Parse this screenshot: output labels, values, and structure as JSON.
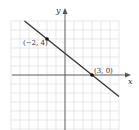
{
  "chart_data": {
    "type": "line",
    "title": "",
    "xlabel": "x",
    "ylabel": "y",
    "xlim": [
      -6,
      6
    ],
    "ylim": [
      -6,
      6
    ],
    "grid": true,
    "series": [
      {
        "name": "line",
        "equation": "y = -4/5 x + 12/5",
        "x": [
          -4.5,
          6
        ],
        "y": [
          6,
          -2.4
        ]
      }
    ],
    "points": [
      {
        "x": -2,
        "y": 4,
        "label": "(−2, 4)"
      },
      {
        "x": 3,
        "y": 0,
        "label": "(3, 0)"
      }
    ],
    "annotations": [
      "(−2, 4)",
      "(3, 0)"
    ]
  },
  "labels": {
    "x_axis": "x",
    "y_axis": "y",
    "point_a": "(−2, 4)",
    "point_b": "(3, 0)"
  },
  "colors": {
    "grid": "#d9d9d9",
    "axis": "#555555",
    "line": "#333333",
    "point": "#111111"
  }
}
